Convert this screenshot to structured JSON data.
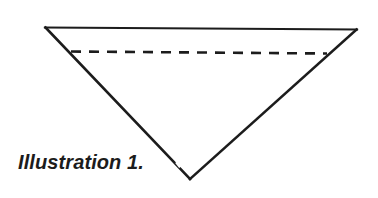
{
  "figure": {
    "caption": "Illustration 1.",
    "background_color": "#ffffff",
    "ink_color": "#1c1c1c",
    "width": 378,
    "height": 198,
    "shape": {
      "name": "inverted-triangle",
      "description": "Downward-pointing triangle outline with a horizontal dashed chord near the top",
      "vertices": {
        "top_left": [
          45,
          27
        ],
        "top_right": [
          357,
          29
        ],
        "bottom_apex": [
          190,
          179
        ]
      },
      "solid_line_width": 2.4,
      "dashed_chord": {
        "start": [
          71,
          51
        ],
        "end": [
          327,
          53
        ],
        "dash_length": 10,
        "dash_gap": 8,
        "line_width": 2.6
      }
    }
  }
}
